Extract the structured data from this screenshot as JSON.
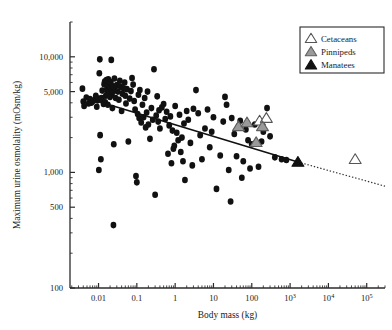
{
  "chart_data": {
    "type": "scatter",
    "title": "",
    "xlabel": "Body mass (kg)",
    "ylabel": "Maximum urine osmolality (mOsm/kg)",
    "xscale": "log",
    "yscale": "log",
    "xlim": [
      0.0018,
      300000
    ],
    "ylim": [
      100,
      20000
    ],
    "grid": false,
    "legend_position": "top-right",
    "xticks": [
      {
        "value": 0.01,
        "label": "0.01"
      },
      {
        "value": 0.1,
        "label": "0.1"
      },
      {
        "value": 1,
        "label": "1"
      },
      {
        "value": 10,
        "label": "10"
      },
      {
        "value": 100,
        "label": "100"
      },
      {
        "value": 1000,
        "label": "10",
        "exp": "3"
      },
      {
        "value": 10000,
        "label": "10",
        "exp": "4"
      },
      {
        "value": 100000,
        "label": "10",
        "exp": "5"
      }
    ],
    "yticks": [
      {
        "value": 100,
        "label": "100"
      },
      {
        "value": 500,
        "label": "500"
      },
      {
        "value": 1000,
        "label": "1,000"
      },
      {
        "value": 5000,
        "label": "5,000"
      },
      {
        "value": 10000,
        "label": "10,000"
      }
    ],
    "series": [
      {
        "name": "Terrestrial mammals",
        "marker": "filled-circle",
        "color": "#111111",
        "points": [
          [
            0.0038,
            5300
          ],
          [
            0.004,
            4100
          ],
          [
            0.0042,
            3750
          ],
          [
            0.0048,
            4450
          ],
          [
            0.0055,
            3950
          ],
          [
            0.006,
            4300
          ],
          [
            0.0065,
            4000
          ],
          [
            0.0072,
            4150
          ],
          [
            0.008,
            4250
          ],
          [
            0.0085,
            4600
          ],
          [
            0.009,
            3700
          ],
          [
            0.0095,
            4200
          ],
          [
            0.01,
            4350
          ],
          [
            0.0102,
            1050
          ],
          [
            0.0105,
            7200
          ],
          [
            0.0108,
            9500
          ],
          [
            0.011,
            2100
          ],
          [
            0.0115,
            1300
          ],
          [
            0.012,
            4400
          ],
          [
            0.0125,
            5100
          ],
          [
            0.013,
            4150
          ],
          [
            0.0135,
            3900
          ],
          [
            0.014,
            5800
          ],
          [
            0.0145,
            6100
          ],
          [
            0.015,
            4050
          ],
          [
            0.0155,
            4600
          ],
          [
            0.016,
            6300
          ],
          [
            0.0165,
            5250
          ],
          [
            0.017,
            4750
          ],
          [
            0.0175,
            3850
          ],
          [
            0.018,
            6400
          ],
          [
            0.0185,
            5600
          ],
          [
            0.019,
            4900
          ],
          [
            0.0195,
            5900
          ],
          [
            0.02,
            4500
          ],
          [
            0.0205,
            5450
          ],
          [
            0.021,
            6050
          ],
          [
            0.0215,
            9400
          ],
          [
            0.022,
            4700
          ],
          [
            0.0225,
            5300
          ],
          [
            0.023,
            3600
          ],
          [
            0.0235,
            4950
          ],
          [
            0.024,
            5550
          ],
          [
            0.0245,
            350
          ],
          [
            0.025,
            1750
          ],
          [
            0.026,
            6500
          ],
          [
            0.027,
            5150
          ],
          [
            0.028,
            4400
          ],
          [
            0.03,
            5700
          ],
          [
            0.032,
            5000
          ],
          [
            0.034,
            4250
          ],
          [
            0.036,
            6200
          ],
          [
            0.038,
            5500
          ],
          [
            0.04,
            3400
          ],
          [
            0.042,
            4800
          ],
          [
            0.045,
            5350
          ],
          [
            0.048,
            6000
          ],
          [
            0.05,
            4600
          ],
          [
            0.052,
            3950
          ],
          [
            0.055,
            5250
          ],
          [
            0.06,
            1850
          ],
          [
            0.065,
            4350
          ],
          [
            0.07,
            5050
          ],
          [
            0.075,
            6550
          ],
          [
            0.08,
            5750
          ],
          [
            0.085,
            4150
          ],
          [
            0.09,
            3500
          ],
          [
            0.095,
            930
          ],
          [
            0.1,
            820
          ],
          [
            0.105,
            3200
          ],
          [
            0.11,
            4700
          ],
          [
            0.115,
            2950
          ],
          [
            0.12,
            5150
          ],
          [
            0.13,
            2700
          ],
          [
            0.14,
            3850
          ],
          [
            0.15,
            3000
          ],
          [
            0.16,
            4400
          ],
          [
            0.17,
            2450
          ],
          [
            0.18,
            3300
          ],
          [
            0.19,
            5000
          ],
          [
            0.2,
            2600
          ],
          [
            0.22,
            1950
          ],
          [
            0.24,
            3600
          ],
          [
            0.26,
            2850
          ],
          [
            0.28,
            7800
          ],
          [
            0.3,
            640
          ],
          [
            0.32,
            3100
          ],
          [
            0.34,
            4550
          ],
          [
            0.36,
            2750
          ],
          [
            0.38,
            3450
          ],
          [
            0.4,
            2400
          ],
          [
            0.45,
            3650
          ],
          [
            0.5,
            3900
          ],
          [
            0.55,
            2900
          ],
          [
            0.6,
            3350
          ],
          [
            0.65,
            1450
          ],
          [
            0.7,
            2550
          ],
          [
            0.75,
            3050
          ],
          [
            0.8,
            1200
          ],
          [
            0.85,
            2300
          ],
          [
            0.9,
            1600
          ],
          [
            0.95,
            1700
          ],
          [
            1.0,
            3750
          ],
          [
            1.1,
            2200
          ],
          [
            1.2,
            1900
          ],
          [
            1.3,
            3150
          ],
          [
            1.4,
            1500
          ],
          [
            1.5,
            2000
          ],
          [
            1.6,
            1250
          ],
          [
            1.7,
            2650
          ],
          [
            1.8,
            860
          ],
          [
            2.0,
            3400
          ],
          [
            2.2,
            2850
          ],
          [
            2.5,
            1800
          ],
          [
            2.8,
            1150
          ],
          [
            3.0,
            3550
          ],
          [
            3.5,
            5150
          ],
          [
            4.0,
            3250
          ],
          [
            4.5,
            2100
          ],
          [
            5.0,
            1300
          ],
          [
            6.0,
            2400
          ],
          [
            7.0,
            3500
          ],
          [
            8.0,
            1650
          ],
          [
            9.0,
            2250
          ],
          [
            10.0,
            3000
          ],
          [
            12.0,
            720
          ],
          [
            15.0,
            1400
          ],
          [
            18.0,
            2750
          ],
          [
            20.0,
            4500
          ],
          [
            22.0,
            3850
          ],
          [
            25.0,
            1050
          ],
          [
            28.0,
            560
          ],
          [
            30.0,
            2950
          ],
          [
            35.0,
            2150
          ],
          [
            40.0,
            1380
          ],
          [
            45.0,
            2500
          ],
          [
            50.0,
            2800
          ],
          [
            55.0,
            900
          ],
          [
            60.0,
            1250
          ],
          [
            70.0,
            2350
          ],
          [
            80.0,
            1900
          ],
          [
            90.0,
            1080
          ],
          [
            100.0,
            1750
          ],
          [
            120.0,
            2600
          ],
          [
            150.0,
            1120
          ],
          [
            180.0,
            1850
          ],
          [
            200.0,
            2250
          ],
          [
            250.0,
            3600
          ],
          [
            300.0,
            2050
          ],
          [
            400.0,
            1350
          ],
          [
            600.0,
            1300
          ],
          [
            800.0,
            1280
          ]
        ]
      },
      {
        "name": "Cetaceans",
        "marker": "open-triangle",
        "color": "#ffffff",
        "points": [
          [
            160,
            2800
          ],
          [
            240,
            2950
          ],
          [
            50000,
            1300
          ]
        ]
      },
      {
        "name": "Pinnipeds",
        "marker": "gray-triangle",
        "color": "#9a9a9a",
        "points": [
          [
            45,
            2500
          ],
          [
            75,
            2700
          ],
          [
            190,
            2500
          ],
          [
            130,
            1820
          ]
        ]
      },
      {
        "name": "Manatees",
        "marker": "filled-triangle",
        "color": "#111111",
        "points": [
          [
            1600,
            1230
          ]
        ]
      }
    ],
    "regression_line": {
      "style_solid": "solid over fitted data range",
      "style_extrapolated": "dotted extrapolation",
      "solid_from": [
        0.0045,
        4450
      ],
      "solid_to": [
        1600,
        1230
      ],
      "dotted_to": [
        300000,
        760
      ]
    },
    "legend": [
      {
        "label": "Cetaceans",
        "marker": "open-triangle"
      },
      {
        "label": "Pinnipeds",
        "marker": "gray-triangle"
      },
      {
        "label": "Manatees",
        "marker": "filled-triangle"
      }
    ]
  }
}
